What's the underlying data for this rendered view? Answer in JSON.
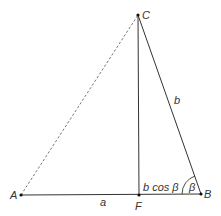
{
  "diagram": {
    "points": {
      "A": {
        "label": "A",
        "x": 21,
        "y": 195
      },
      "B": {
        "label": "B",
        "x": 201,
        "y": 194
      },
      "C": {
        "label": "C",
        "x": 138,
        "y": 15
      },
      "F": {
        "label": "F",
        "x": 139,
        "y": 195
      }
    },
    "segments": [
      {
        "from": "A",
        "to": "B",
        "style": "solid"
      },
      {
        "from": "C",
        "to": "F",
        "style": "solid"
      },
      {
        "from": "C",
        "to": "B",
        "style": "solid"
      },
      {
        "from": "A",
        "to": "C",
        "style": "dashed"
      }
    ],
    "labels": {
      "side_a": "a",
      "side_b": "b",
      "projection": "b cos β",
      "angle": "β"
    },
    "colors": {
      "line": "#333333",
      "dashed": "#777777",
      "background": "#ffffff"
    }
  }
}
